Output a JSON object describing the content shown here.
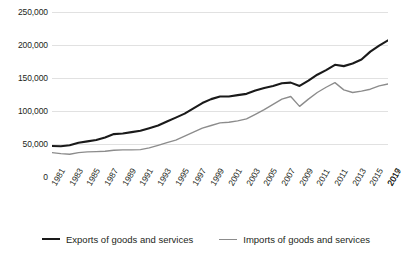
{
  "chart_data": {
    "type": "line",
    "title": "",
    "subtitle": "",
    "xlabel": "",
    "ylabel": "",
    "grid": "horizontal",
    "legend_position": "bottom",
    "xlim": [
      1981,
      2019
    ],
    "ylim": [
      0,
      250000
    ],
    "y_ticks": [
      0,
      50000,
      100000,
      150000,
      200000,
      250000
    ],
    "y_tick_labels": [
      "0",
      "50,000",
      "100,000",
      "150,000",
      "200,000",
      "250,000"
    ],
    "x": [
      1981,
      1982,
      1983,
      1984,
      1985,
      1986,
      1987,
      1988,
      1989,
      1990,
      1991,
      1992,
      1993,
      1994,
      1995,
      1996,
      1997,
      1998,
      1999,
      2000,
      2001,
      2002,
      2003,
      2004,
      2005,
      2006,
      2007,
      2008,
      2009,
      2010,
      2011,
      2012,
      2013,
      2014,
      2015,
      2016,
      2017,
      2018,
      2019
    ],
    "x_tick_labels": [
      "1981",
      "1983",
      "1985",
      "1987",
      "1989",
      "1991",
      "1993",
      "1995",
      "1997",
      "1999",
      "2001",
      "2003",
      "2005",
      "2007",
      "2009",
      "2011",
      "2011",
      "2013",
      "2015",
      "2017",
      "2019"
    ],
    "colors": {
      "exports": "#1a1a1a",
      "imports": "#8c8c8c",
      "gridline": "#d9d9d9",
      "background": "#ffffff"
    },
    "series": [
      {
        "name": "Exports of goods and services",
        "color": "#1a1a1a",
        "values": [
          47000,
          46500,
          48000,
          52000,
          54000,
          56000,
          60000,
          65000,
          66000,
          68000,
          70000,
          74000,
          78000,
          84000,
          90000,
          96000,
          104000,
          112000,
          118000,
          122000,
          122000,
          124000,
          126000,
          131000,
          135000,
          138000,
          142000,
          143000,
          138000,
          146000,
          155000,
          162000,
          170000,
          168000,
          172000,
          178000,
          190000,
          199000,
          207000
        ]
      },
      {
        "name": "Imports of goods and services",
        "color": "#8c8c8c",
        "values": [
          37000,
          35500,
          34500,
          37000,
          38000,
          38500,
          39000,
          40500,
          41000,
          41000,
          41500,
          44000,
          48000,
          52000,
          56000,
          62000,
          68000,
          74000,
          78000,
          82000,
          83000,
          85000,
          88000,
          95000,
          102000,
          110000,
          118000,
          122000,
          107000,
          118000,
          128000,
          136000,
          143000,
          132000,
          128000,
          130000,
          133000,
          138000,
          141000
        ]
      }
    ],
    "legend": [
      {
        "label": "Exports of goods and services",
        "style": "exports"
      },
      {
        "label": "Imports of goods and services",
        "style": "imports"
      }
    ]
  }
}
